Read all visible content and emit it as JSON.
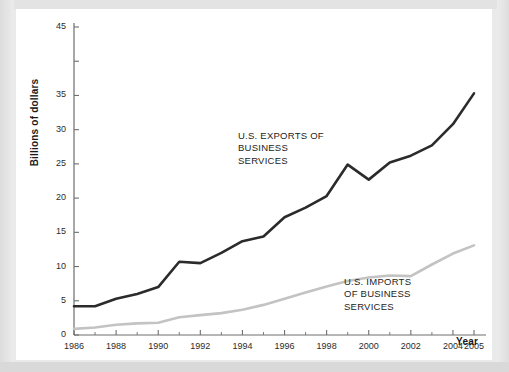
{
  "chart_data": {
    "type": "line",
    "title": "",
    "xlabel": "Year",
    "ylabel": "Billions of dollars",
    "xlim": [
      1986,
      2005
    ],
    "ylim": [
      0,
      45
    ],
    "grid": false,
    "legend_position": "inline-annotations",
    "x": [
      1986,
      1987,
      1988,
      1989,
      1990,
      1991,
      1992,
      1993,
      1994,
      1995,
      1996,
      1997,
      1998,
      1999,
      2000,
      2001,
      2002,
      2003,
      2004,
      2005
    ],
    "xtick_labels": [
      "1986",
      "1988",
      "1990",
      "1992",
      "1994",
      "1996",
      "1998",
      "2000",
      "2002",
      "2004",
      "2005"
    ],
    "xtick_values": [
      1986,
      1988,
      1990,
      1992,
      1994,
      1996,
      1998,
      2000,
      2002,
      2004,
      2005
    ],
    "ytick_labels": [
      "0",
      "5",
      "10",
      "15",
      "20",
      "25",
      "30",
      "35",
      "45"
    ],
    "ytick_values": [
      0,
      5,
      10,
      15,
      20,
      25,
      30,
      35,
      45
    ],
    "series": [
      {
        "name": "U.S. EXPORTS OF BUSINESS SERVICES",
        "color": "#2b2b2b",
        "width": 2.6,
        "values": [
          4.2,
          4.2,
          5.3,
          6.0,
          7.0,
          10.7,
          10.5,
          12.0,
          13.7,
          14.4,
          17.2,
          18.6,
          20.3,
          24.9,
          22.7,
          25.2,
          26.2,
          27.7,
          30.8,
          35.3
        ]
      },
      {
        "name": "U.S. IMPORTS OF BUSINESS SERVICES",
        "color": "#c3c3c3",
        "width": 2.6,
        "values": [
          0.9,
          1.1,
          1.5,
          1.7,
          1.8,
          2.6,
          2.9,
          3.2,
          3.7,
          4.4,
          5.3,
          6.2,
          7.1,
          7.9,
          8.4,
          8.7,
          8.6,
          10.3,
          11.9,
          13.1
        ]
      }
    ],
    "annotations": [
      {
        "id": "exports",
        "text": "U.S. EXPORTS OF\nBUSINESS\nSERVICES"
      },
      {
        "id": "imports",
        "text": "U.S. IMPORTS\nOF BUSINESS\nSERVICES"
      }
    ]
  },
  "axes": {
    "y_title": "Billions of dollars",
    "x_title": "Year"
  },
  "colors": {
    "exports_line": "#2b2b2b",
    "imports_line": "#c3c3c3",
    "axis": "#6e6e6e",
    "card_background": "#ffffff",
    "page_background": "#e9eaea"
  }
}
